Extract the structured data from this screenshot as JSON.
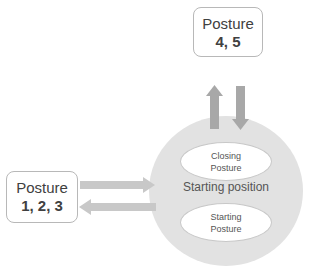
{
  "nodes": {
    "posture_top": {
      "line1": "Posture",
      "line2": "4, 5"
    },
    "posture_left": {
      "line1": "Posture",
      "line2": "1, 2, 3"
    },
    "center": {
      "label": "Starting position"
    },
    "closing": {
      "line1": "Closing",
      "line2": "Posture"
    },
    "starting": {
      "line1": "Starting",
      "line2": "Posture"
    }
  },
  "colors": {
    "arrow_fill": "#a8a8a8",
    "circle_fill": "#e2e2e2",
    "box_border": "#b8b8b8",
    "text": "#404040"
  }
}
